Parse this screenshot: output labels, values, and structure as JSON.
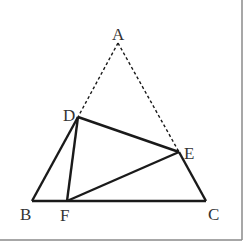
{
  "figure": {
    "type": "geometry",
    "colors": {
      "line": "#1a1a1a",
      "dashed": "#1a1a1a",
      "frame": "#8a8a8a",
      "label": "#333333",
      "background": "#ffffff"
    },
    "points": {
      "A": {
        "label": "A",
        "x": 118,
        "y": 43
      },
      "B": {
        "label": "B",
        "x": 32,
        "y": 201
      },
      "C": {
        "label": "C",
        "x": 206,
        "y": 201
      },
      "D": {
        "label": "D",
        "x": 78,
        "y": 117
      },
      "E": {
        "label": "E",
        "x": 179,
        "y": 152
      },
      "F": {
        "label": "F",
        "x": 67,
        "y": 201
      }
    },
    "solid_segments": [
      "BD",
      "BC",
      "CE",
      "DE",
      "DF",
      "EF"
    ],
    "dashed_segments": [
      "AD",
      "AE"
    ]
  }
}
